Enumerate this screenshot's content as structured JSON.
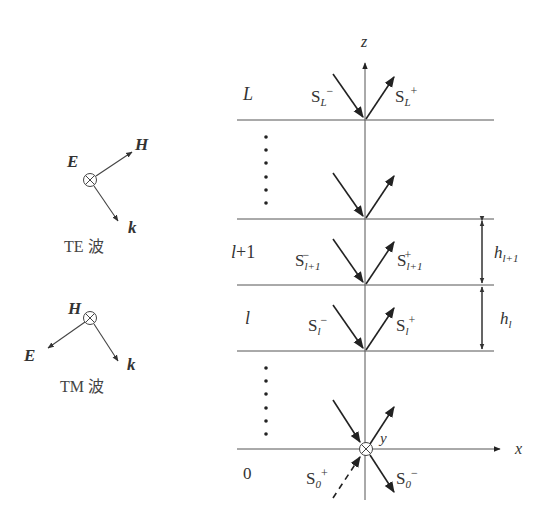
{
  "te_wave": {
    "caption": "TE 波",
    "E_label": "E",
    "H_label": "H",
    "k_label": "k"
  },
  "tm_wave": {
    "caption": "TM 波",
    "E_label": "E",
    "H_label": "H",
    "k_label": "k"
  },
  "axes": {
    "z_label": "z",
    "x_label": "x",
    "y_label": "y"
  },
  "layers": [
    {
      "name": "L",
      "label": "L",
      "down_wave": "S",
      "down_sub": "L",
      "down_sup": "−",
      "up_wave": "S",
      "up_sub": "L",
      "up_sup": "+"
    },
    {
      "name": "l+1",
      "label": "l+1",
      "down_wave": "S",
      "down_sub": "l+1",
      "down_sup": "−",
      "up_wave": "S",
      "up_sub": "l+1",
      "up_sup": "+",
      "thickness": "h",
      "thickness_sub": "l+1"
    },
    {
      "name": "l",
      "label": "l",
      "down_wave": "S",
      "down_sub": "l",
      "down_sup": "−",
      "up_wave": "S",
      "up_sub": "l",
      "up_sup": "+",
      "thickness": "h",
      "thickness_sub": "l"
    },
    {
      "name": "0",
      "label": "0",
      "in_wave": "S",
      "in_sub": "0",
      "in_sup": "+",
      "out_wave": "S",
      "out_sub": "0",
      "out_sup": "−"
    }
  ],
  "ellipsis": "⋮"
}
